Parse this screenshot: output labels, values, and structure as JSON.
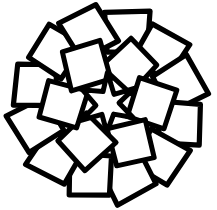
{
  "figure": {
    "background_color": "#ffffff",
    "stroke_color": "#000000",
    "fill_color": "#ffffff",
    "stroke_width_outer": 5.2,
    "stroke_width_inner": 5.0,
    "canvas": {
      "width": 217,
      "height": 210
    },
    "center": {
      "x": 108,
      "y": 104
    }
  },
  "shapes": {
    "center_star": {
      "name": "six-pointed-star",
      "points": 6,
      "outer_radius": 30,
      "inner_radius": 12.5,
      "rotation_deg": -90
    },
    "inner_ring": {
      "name": "inner-square-ring",
      "count": 6,
      "orbit_radius": 44,
      "square_half_size": 20,
      "tilt_deg": 16,
      "start_angle_deg": -60
    },
    "outer_ring": {
      "name": "outer-square-ring",
      "count": 12,
      "orbit_radius": 74,
      "square_half_size": 21,
      "tilt_deg": -14,
      "start_angle_deg": -75
    }
  }
}
